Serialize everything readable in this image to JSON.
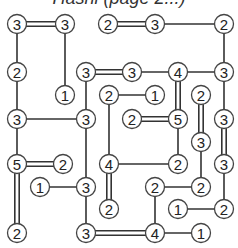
{
  "title": "Hashi (page 2...)",
  "colors": {
    "line": "#333333",
    "circle_stroke": "#444444",
    "circle_fill": "#ffffff",
    "text": "#222222"
  },
  "puzzle": {
    "type": "hashiwokakero",
    "nodes": [
      {
        "id": "a",
        "x": 17,
        "y": 24,
        "value": 3
      },
      {
        "id": "b",
        "x": 65,
        "y": 24,
        "value": 3
      },
      {
        "id": "c",
        "x": 108,
        "y": 24,
        "value": 2
      },
      {
        "id": "d",
        "x": 155,
        "y": 24,
        "value": 3
      },
      {
        "id": "e",
        "x": 224,
        "y": 24,
        "value": 2
      },
      {
        "id": "f",
        "x": 17,
        "y": 72,
        "value": 2
      },
      {
        "id": "g",
        "x": 86,
        "y": 72,
        "value": 3
      },
      {
        "id": "h",
        "x": 132,
        "y": 72,
        "value": 3
      },
      {
        "id": "i",
        "x": 178,
        "y": 72,
        "value": 4
      },
      {
        "id": "j",
        "x": 224,
        "y": 72,
        "value": 3
      },
      {
        "id": "k",
        "x": 65,
        "y": 95,
        "value": 1
      },
      {
        "id": "l",
        "x": 109,
        "y": 95,
        "value": 2
      },
      {
        "id": "m",
        "x": 155,
        "y": 95,
        "value": 1
      },
      {
        "id": "n",
        "x": 201,
        "y": 95,
        "value": 2
      },
      {
        "id": "o",
        "x": 17,
        "y": 119,
        "value": 3
      },
      {
        "id": "p",
        "x": 86,
        "y": 119,
        "value": 3
      },
      {
        "id": "q",
        "x": 132,
        "y": 119,
        "value": 2
      },
      {
        "id": "r",
        "x": 178,
        "y": 119,
        "value": 5
      },
      {
        "id": "s",
        "x": 224,
        "y": 119,
        "value": 3
      },
      {
        "id": "t",
        "x": 201,
        "y": 142,
        "value": 3
      },
      {
        "id": "u",
        "x": 17,
        "y": 164,
        "value": 5
      },
      {
        "id": "v",
        "x": 63,
        "y": 164,
        "value": 2
      },
      {
        "id": "w",
        "x": 109,
        "y": 164,
        "value": 4
      },
      {
        "id": "x",
        "x": 178,
        "y": 164,
        "value": 2
      },
      {
        "id": "y",
        "x": 224,
        "y": 164,
        "value": 3
      },
      {
        "id": "z",
        "x": 40,
        "y": 187,
        "value": 1
      },
      {
        "id": "A",
        "x": 86,
        "y": 187,
        "value": 3
      },
      {
        "id": "B",
        "x": 155,
        "y": 187,
        "value": 2
      },
      {
        "id": "C",
        "x": 201,
        "y": 187,
        "value": 2
      },
      {
        "id": "D",
        "x": 109,
        "y": 209,
        "value": 2
      },
      {
        "id": "E",
        "x": 178,
        "y": 209,
        "value": 1
      },
      {
        "id": "F",
        "x": 224,
        "y": 209,
        "value": 2
      },
      {
        "id": "G",
        "x": 17,
        "y": 233,
        "value": 2
      },
      {
        "id": "H",
        "x": 86,
        "y": 233,
        "value": 3
      },
      {
        "id": "I",
        "x": 155,
        "y": 233,
        "value": 4
      },
      {
        "id": "J",
        "x": 201,
        "y": 233,
        "value": 1
      }
    ],
    "bridges": [
      {
        "from": "a",
        "to": "b",
        "count": 2
      },
      {
        "from": "a",
        "to": "f",
        "count": 1
      },
      {
        "from": "f",
        "to": "o",
        "count": 1
      },
      {
        "from": "o",
        "to": "p",
        "count": 1
      },
      {
        "from": "o",
        "to": "u",
        "count": 1
      },
      {
        "from": "u",
        "to": "v",
        "count": 2
      },
      {
        "from": "u",
        "to": "G",
        "count": 2
      },
      {
        "from": "b",
        "to": "k",
        "count": 1
      },
      {
        "from": "c",
        "to": "d",
        "count": 2
      },
      {
        "from": "d",
        "to": "e",
        "count": 1
      },
      {
        "from": "e",
        "to": "j",
        "count": 1
      },
      {
        "from": "g",
        "to": "h",
        "count": 2
      },
      {
        "from": "g",
        "to": "p",
        "count": 1
      },
      {
        "from": "h",
        "to": "i",
        "count": 1
      },
      {
        "from": "i",
        "to": "j",
        "count": 1
      },
      {
        "from": "i",
        "to": "r",
        "count": 2
      },
      {
        "from": "j",
        "to": "s",
        "count": 1
      },
      {
        "from": "l",
        "to": "m",
        "count": 1
      },
      {
        "from": "l",
        "to": "w",
        "count": 1
      },
      {
        "from": "n",
        "to": "t",
        "count": 2
      },
      {
        "from": "q",
        "to": "r",
        "count": 2
      },
      {
        "from": "r",
        "to": "x",
        "count": 1
      },
      {
        "from": "s",
        "to": "y",
        "count": 2
      },
      {
        "from": "t",
        "to": "C",
        "count": 1
      },
      {
        "from": "p",
        "to": "A",
        "count": 1
      },
      {
        "from": "w",
        "to": "x",
        "count": 1
      },
      {
        "from": "w",
        "to": "D",
        "count": 2
      },
      {
        "from": "y",
        "to": "F",
        "count": 1
      },
      {
        "from": "z",
        "to": "A",
        "count": 1
      },
      {
        "from": "A",
        "to": "H",
        "count": 1
      },
      {
        "from": "B",
        "to": "C",
        "count": 1
      },
      {
        "from": "B",
        "to": "I",
        "count": 1
      },
      {
        "from": "E",
        "to": "F",
        "count": 1
      },
      {
        "from": "H",
        "to": "I",
        "count": 2
      },
      {
        "from": "I",
        "to": "J",
        "count": 1
      }
    ]
  }
}
